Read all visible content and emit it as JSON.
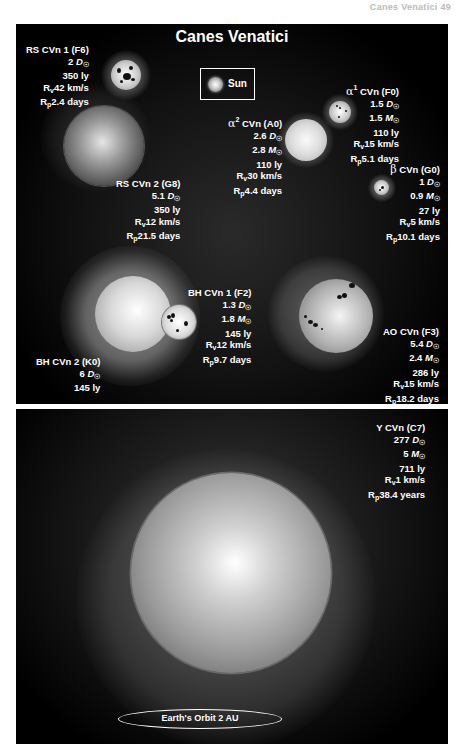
{
  "page_header": "Canes Venatici   49",
  "diagram": {
    "title": "Canes Venatici",
    "legend": {
      "sun_label": "Sun"
    },
    "stars": [
      {
        "id": "rs-cvn-1",
        "name": "RS CVn 1 (F6)",
        "diameter": "2",
        "distance": "350 ly",
        "rv": "42 km/s",
        "rp": "2.4 days"
      },
      {
        "id": "rs-cvn-2",
        "name": "RS CVn 2 (G8)",
        "diameter": "5.1",
        "distance": "350 ly",
        "rv": "12 km/s",
        "rp": "21.5 days"
      },
      {
        "id": "alpha1-cvn",
        "greek": "α",
        "sup": "1",
        "name": "CVn (F0)",
        "diameter": "1.5",
        "mass": "1.5",
        "distance": "110 ly",
        "rv": "15 km/s",
        "rp": "5.1 days"
      },
      {
        "id": "alpha2-cvn",
        "greek": "α",
        "sup": "2",
        "name": "CVn (A0)",
        "diameter": "2.6",
        "mass": "2.8",
        "distance": "110 ly",
        "rv": "30 km/s",
        "rp": "4.4 days"
      },
      {
        "id": "beta-cvn",
        "greek": "β",
        "name": "CVn (G0)",
        "diameter": "1",
        "mass": "0.9",
        "distance": "27 ly",
        "rv": "5 km/s",
        "rp": "10.1 days"
      },
      {
        "id": "bh-cvn-1",
        "name": "BH CVn 1 (F2)",
        "diameter": "1.3",
        "mass": "1.8",
        "distance": "145 ly",
        "rv": "12 km/s",
        "rp": "9.7 days"
      },
      {
        "id": "bh-cvn-2",
        "name": "BH CVn 2 (K0)",
        "diameter": "6",
        "distance": "145 ly"
      },
      {
        "id": "ao-cvn",
        "name": "AO CVn (F3)",
        "diameter": "5.4",
        "mass": "2.4",
        "distance": "286 ly",
        "rv": "15 km/s",
        "rp": "18.2 days"
      },
      {
        "id": "y-cvn",
        "name": "Y CVn (C7)",
        "diameter": "277",
        "mass": "5",
        "distance": "711 ly",
        "rv": "1 km/s",
        "rp": "38.4 years"
      }
    ],
    "units": {
      "d_sun": "D",
      "m_sun": "M",
      "sun_symbol": "☉",
      "rv": "R",
      "rv_sub": "v",
      "rp": "R",
      "rp_sub": "p"
    },
    "orbit_label": "Earth's Orbit 2 AU"
  }
}
